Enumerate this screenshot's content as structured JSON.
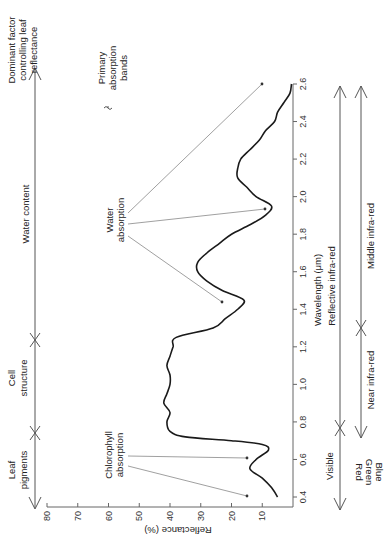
{
  "chart_data": {
    "type": "line",
    "orientation": "rotated 90° counter-clockwise (wavelength axis vertical on right, reflectance axis horizontal along bottom)",
    "title": "",
    "xlabel": "Wavelength (μm)",
    "ylabel": "Reflectance (%)",
    "xlim": [
      0.4,
      2.6
    ],
    "ylim": [
      0,
      80
    ],
    "xticks": [
      "0.4",
      "0.6",
      "0.8",
      "1.0",
      "1.2",
      "1.4",
      "1.6",
      "1.8",
      "2.0",
      "2.2",
      "2.4",
      "2.6"
    ],
    "yticks": [
      "80",
      "70",
      "60",
      "50",
      "40",
      "30",
      "20",
      "10"
    ],
    "grid": false,
    "series": [
      {
        "name": "Leaf reflectance",
        "x": [
          0.4,
          0.45,
          0.5,
          0.55,
          0.6,
          0.65,
          0.68,
          0.7,
          0.72,
          0.75,
          0.8,
          0.85,
          0.9,
          0.95,
          1.0,
          1.05,
          1.1,
          1.15,
          1.2,
          1.25,
          1.3,
          1.35,
          1.4,
          1.45,
          1.5,
          1.55,
          1.6,
          1.65,
          1.7,
          1.75,
          1.8,
          1.85,
          1.9,
          1.95,
          2.0,
          2.05,
          2.1,
          2.15,
          2.2,
          2.25,
          2.3,
          2.35,
          2.4,
          2.45,
          2.5,
          2.55
        ],
        "values": [
          5,
          7,
          10,
          14,
          12,
          8,
          10,
          20,
          35,
          40,
          41,
          40,
          42,
          41,
          40,
          40,
          41,
          40,
          39,
          38,
          26,
          22,
          18,
          16,
          23,
          28,
          31,
          31,
          28,
          24,
          20,
          14,
          9,
          7,
          12,
          15,
          18,
          18,
          17,
          14,
          11,
          9,
          6,
          5,
          3,
          1
        ]
      }
    ],
    "annotations": [
      {
        "text": "Chlorophyll absorption",
        "points_to_wavelengths": [
          0.45,
          0.67
        ]
      },
      {
        "text": "Water absorption",
        "points_to_wavelengths": [
          1.45,
          1.95,
          2.6
        ]
      },
      {
        "text": "Primary absorption bands",
        "type": "brace-legend"
      }
    ],
    "legend_position": "none"
  },
  "labels": {
    "dominant_factor": [
      "Dominant factor",
      "controlling leaf",
      "reflectance"
    ],
    "primary_bands": [
      "Primary",
      "absorption",
      "bands"
    ],
    "water_content": "Water content",
    "cell_structure": [
      "Cell",
      "structure"
    ],
    "leaf_pigments": [
      "Leaf",
      "pigments"
    ],
    "chlorophyll": [
      "Chlorophyll",
      "absorption"
    ],
    "water_absorption": [
      "Water",
      "absorption"
    ],
    "reflectance_axis": "Reflectance (%)",
    "wavelength_axis": "Wavelength (μm)",
    "reflective_ir": "Reflective infra-red",
    "middle_ir": "Middle infra-red",
    "near_ir": "Near infra-red",
    "visible": "Visible",
    "colors": [
      "Blue",
      "Green",
      "Red"
    ]
  },
  "colors": {
    "curve": "#1a1a1a",
    "axis": "#666666",
    "pointer": "#888888",
    "text": "#222222"
  }
}
